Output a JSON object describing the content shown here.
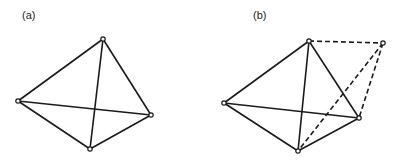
{
  "panels": [
    {
      "label": "(a)",
      "label_pos": [
        22,
        9
      ],
      "vertices": [
        [
          103,
          39
        ],
        [
          18,
          101
        ],
        [
          151,
          115
        ],
        [
          90,
          149
        ]
      ],
      "solid_edges": [
        [
          0,
          1
        ],
        [
          0,
          2
        ],
        [
          0,
          3
        ],
        [
          1,
          2
        ],
        [
          1,
          3
        ],
        [
          2,
          3
        ]
      ],
      "dashed_edges": []
    },
    {
      "label": "(b)",
      "label_pos": [
        253,
        9
      ],
      "vertices": [
        [
          309,
          41
        ],
        [
          224,
          103
        ],
        [
          359,
          118
        ],
        [
          298,
          151
        ],
        [
          383,
          43
        ]
      ],
      "solid_edges": [
        [
          0,
          1
        ],
        [
          0,
          2
        ],
        [
          0,
          3
        ],
        [
          1,
          2
        ],
        [
          1,
          3
        ],
        [
          2,
          3
        ]
      ],
      "dashed_edges": [
        [
          0,
          4
        ],
        [
          4,
          2
        ],
        [
          4,
          3
        ]
      ]
    }
  ],
  "colors": {
    "stroke": "#1a1a1a",
    "background": "#ffffff"
  }
}
